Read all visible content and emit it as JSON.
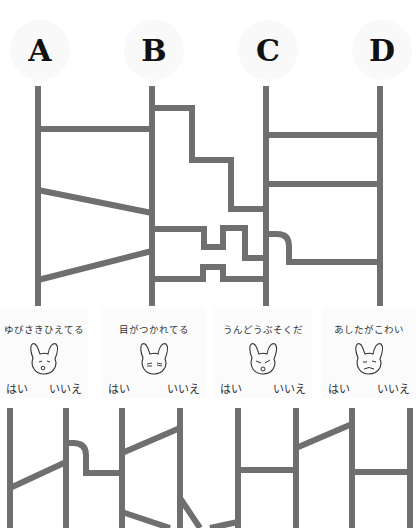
{
  "columns": [
    {
      "label": "A",
      "x": 38
    },
    {
      "label": "B",
      "x": 152
    },
    {
      "label": "C",
      "x": 266
    },
    {
      "label": "D",
      "x": 380
    }
  ],
  "colors": {
    "line": "#6f6f6f",
    "badge": "#f9f9f9",
    "text": "#111111"
  },
  "cards": [
    {
      "title": "ゆびさきひえてる",
      "yes": "はい",
      "no": "いいえ",
      "icon": "rabbit-cold-icon"
    },
    {
      "title": "目がつかれてる",
      "ruby": "め",
      "yes": "はい",
      "no": "いいえ",
      "icon": "rabbit-tired-icon"
    },
    {
      "title": "うんどうぶそくだ",
      "yes": "はい",
      "no": "いいえ",
      "icon": "rabbit-inactive-icon"
    },
    {
      "title": "あしたがこわい",
      "yes": "はい",
      "no": "いいえ",
      "icon": "rabbit-worried-icon"
    }
  ]
}
